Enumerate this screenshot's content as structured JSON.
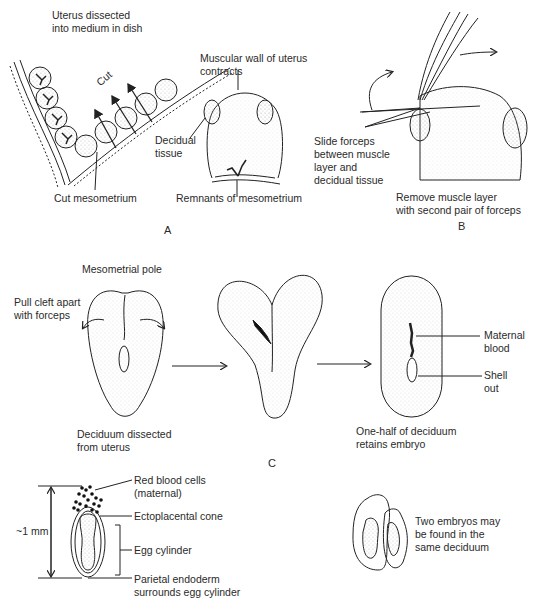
{
  "panels": {
    "A": {
      "letter": "A",
      "labels": {
        "uterus": "Uterus dissected\ninto medium in dish",
        "cut": "Cut",
        "muscular_wall": "Muscular wall of uterus\ncontracts",
        "decidual_tissue": "Decidual\ntissue",
        "cut_mesometrium": "Cut mesometrium",
        "remnants": "Remnants of mesometrium"
      }
    },
    "B": {
      "letter": "B",
      "labels": {
        "slide_forceps": "Slide forceps\nbetween muscle\nlayer and\ndecidual tissue",
        "remove_muscle": "Remove muscle layer\nwith second pair of forceps"
      }
    },
    "C": {
      "letter": "C",
      "labels": {
        "mesometrial_pole": "Mesometrial pole",
        "pull_cleft": "Pull cleft apart\nwith forceps",
        "deciduum_dissected": "Deciduum dissected\nfrom uterus",
        "one_half": "One-half of deciduum\nretains embryo",
        "maternal_blood": "Maternal\nblood",
        "shell_out": "Shell\nout"
      }
    },
    "D": {
      "labels": {
        "scale": "~1 mm",
        "red_blood_cells": "Red blood cells\n(maternal)",
        "ectoplacental_cone": "Ectoplacental cone",
        "egg_cylinder": "Egg cylinder",
        "parietal_endoderm": "Parietal endoderm\nsurrounds egg cylinder"
      }
    },
    "E": {
      "labels": {
        "two_embryos": "Two embryos may\nbe found in the\nsame deciduum"
      }
    }
  },
  "colors": {
    "ink": "#2a2a2a",
    "stipple": "#c8c8c8",
    "background": "#ffffff"
  }
}
